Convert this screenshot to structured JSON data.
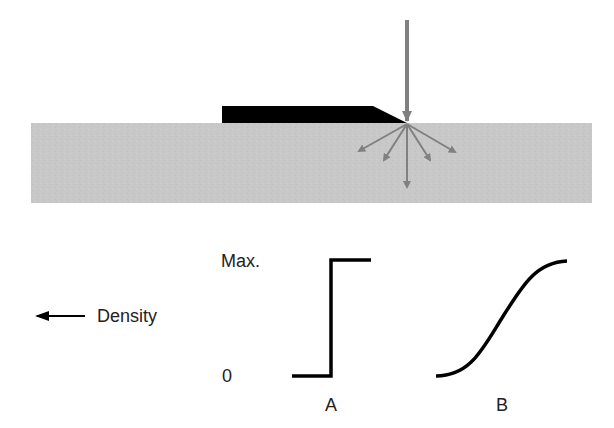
{
  "diagram": {
    "top_panel": {
      "substrate": {
        "label": "",
        "color": "#c8c8c8"
      },
      "mask": {
        "color": "#000000"
      },
      "incident_beam": {
        "color": "#808080",
        "direction": "down"
      },
      "scattered_rays": {
        "count": 5,
        "color": "#808080"
      }
    },
    "bottom_panel": {
      "y_axis": {
        "max_label": "Max.",
        "zero_label": "0"
      },
      "direction_label": "Density",
      "direction_arrow": "left-arrow",
      "profiles": [
        {
          "id": "A",
          "label": "A",
          "shape": "step"
        },
        {
          "id": "B",
          "label": "B",
          "shape": "sigmoid"
        }
      ]
    }
  }
}
